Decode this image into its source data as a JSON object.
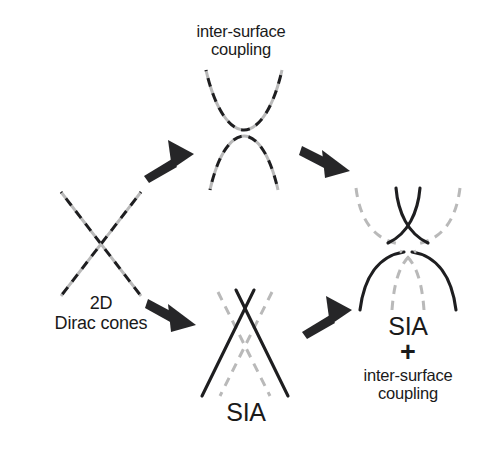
{
  "figure": {
    "type": "schematic-diagram",
    "background_color": "#ffffff",
    "line_colors": {
      "solid_black": "#1e1e20",
      "dashed_gray": "#b9b9b9",
      "arrow": "#262628"
    }
  },
  "nodes": {
    "start": {
      "id": "2d-dirac-cones",
      "label_line1": "2D",
      "label_line2": "Dirac cones",
      "graphic": "two overlapping dashed lines crossing in an X (linear Dirac crossing)"
    },
    "top": {
      "id": "inter-surface-coupling",
      "label_line1": "inter-surface",
      "label_line2": "coupling",
      "graphic": "gapped pair of parabolas: upper U-shape and lower inverted-U, dashed black over dashed gray"
    },
    "bottom": {
      "id": "sia",
      "label": "SIA",
      "graphic": "solid black X crossing plus gray dashed X shifted, spin-split linear bands"
    },
    "final": {
      "id": "sia-plus-inter-surface-coupling",
      "label_line1": "SIA",
      "label_plus": "+",
      "label_line2": "inter-surface",
      "label_line3": "coupling",
      "graphic": "upper solid black crossing with gray dashed outer parabolas; lower solid black inverted parabola with gray dashed inner crossing"
    }
  },
  "arrows": [
    {
      "id": "arrow-start-to-top",
      "from": "2d-dirac-cones",
      "to": "inter-surface-coupling",
      "direction": "up-right"
    },
    {
      "id": "arrow-top-to-final",
      "from": "inter-surface-coupling",
      "to": "sia-plus-inter-surface-coupling",
      "direction": "down-right"
    },
    {
      "id": "arrow-start-to-bottom",
      "from": "2d-dirac-cones",
      "to": "sia",
      "direction": "down-right"
    },
    {
      "id": "arrow-bottom-to-final",
      "from": "sia",
      "to": "sia-plus-inter-surface-coupling",
      "direction": "up-right"
    }
  ]
}
